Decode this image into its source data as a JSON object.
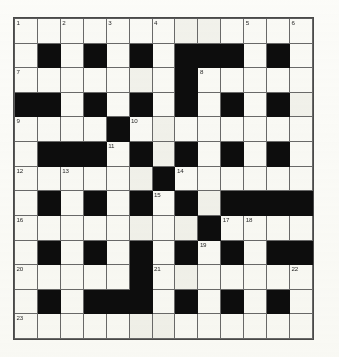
{
  "puzzle": {
    "type": "crossword",
    "title": "Crossword Grid",
    "columns": 13,
    "rows": 13,
    "colors": {
      "block": "#0d0d0d",
      "cell": "#fbfbf8",
      "grid_line": "#6a6a6a",
      "number": "#2a2a2a"
    },
    "legend": {
      "white_symbol": ".",
      "black_symbol": "#"
    },
    "grid": [
      ".............",
      ".#.#.#.###.#.",
      ".......#.....",
      "##.#.#.#.#.#.",
      "....#........",
      ".###.#.#.#.#.",
      "......#......",
      ".#.#.#.#.####",
      "........#....",
      ".#.#.#.#.#.##",
      ".....#.......",
      ".#.###.#.#.#.",
      "............."
    ],
    "numbers": [
      {
        "n": 1,
        "row": 1,
        "col": 1
      },
      {
        "n": 2,
        "row": 1,
        "col": 3
      },
      {
        "n": 3,
        "row": 1,
        "col": 5
      },
      {
        "n": 4,
        "row": 1,
        "col": 7
      },
      {
        "n": 5,
        "row": 1,
        "col": 11
      },
      {
        "n": 6,
        "row": 1,
        "col": 13
      },
      {
        "n": 7,
        "row": 3,
        "col": 1
      },
      {
        "n": 8,
        "row": 3,
        "col": 9
      },
      {
        "n": 9,
        "row": 5,
        "col": 1
      },
      {
        "n": 10,
        "row": 5,
        "col": 6
      },
      {
        "n": 11,
        "row": 6,
        "col": 5
      },
      {
        "n": 12,
        "row": 7,
        "col": 1
      },
      {
        "n": 13,
        "row": 7,
        "col": 3
      },
      {
        "n": 14,
        "row": 7,
        "col": 8
      },
      {
        "n": 15,
        "row": 8,
        "col": 7
      },
      {
        "n": 16,
        "row": 9,
        "col": 1
      },
      {
        "n": 17,
        "row": 9,
        "col": 10
      },
      {
        "n": 18,
        "row": 9,
        "col": 11
      },
      {
        "n": 19,
        "row": 10,
        "col": 9
      },
      {
        "n": 20,
        "row": 11,
        "col": 1
      },
      {
        "n": 21,
        "row": 11,
        "col": 7
      },
      {
        "n": 22,
        "row": 11,
        "col": 13
      },
      {
        "n": 23,
        "row": 13,
        "col": 1
      }
    ],
    "entries": []
  }
}
